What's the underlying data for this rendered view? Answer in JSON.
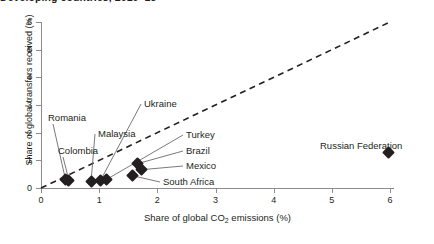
{
  "chart_data": {
    "type": "scatter",
    "title": "Developing countries, 2010–15",
    "xlabel": "Share of global CO2 emissions (%)",
    "xlabel_pre": "Share of global CO",
    "xlabel_sub": "2",
    "xlabel_post": " emissions (%)",
    "ylabel": "Share of global transfers received (%)",
    "xlim": [
      0,
      6
    ],
    "ylim": [
      0,
      6
    ],
    "xticks": [
      0,
      1,
      2,
      3,
      4,
      5,
      6
    ],
    "yticks": [
      0,
      1,
      2,
      3,
      4,
      5,
      6
    ],
    "xtick_labels": [
      "0",
      "1",
      "2",
      "3",
      "4",
      "5",
      "6"
    ],
    "ytick_labels": [
      "0",
      "1",
      "2",
      "3",
      "4",
      "5",
      "6"
    ],
    "grid": false,
    "legend": "none",
    "reference_line": {
      "name": "parity-line",
      "style": "dashed",
      "from": [
        0,
        0
      ],
      "to": [
        6.0,
        6.0
      ]
    },
    "points": [
      {
        "label": "Romania",
        "x": 0.42,
        "y": 0.32
      },
      {
        "label": "Colombia",
        "x": 0.48,
        "y": 0.28
      },
      {
        "label": "Malaysia",
        "x": 0.86,
        "y": 0.22
      },
      {
        "label": "Ukraine",
        "x": 1.02,
        "y": 0.26
      },
      {
        "label": "Turkey",
        "x": 1.12,
        "y": 0.3
      },
      {
        "label": "Brazil",
        "x": 1.66,
        "y": 0.88
      },
      {
        "label": "Mexico",
        "x": 1.72,
        "y": 0.66
      },
      {
        "label": "South Africa",
        "x": 1.58,
        "y": 0.44
      },
      {
        "label": "Russian Federation",
        "x": 5.98,
        "y": 1.3
      }
    ],
    "point_labels": [
      {
        "text": "Romania",
        "lx": 48,
        "ly": 113
      },
      {
        "text": "Colombia",
        "lx": 58,
        "ly": 146
      },
      {
        "text": "Malaysia",
        "lx": 98,
        "ly": 129
      },
      {
        "text": "Ukraine",
        "lx": 144,
        "ly": 99
      },
      {
        "text": "Turkey",
        "lx": 186,
        "ly": 130
      },
      {
        "text": "Brazil",
        "lx": 186,
        "ly": 146
      },
      {
        "text": "Mexico",
        "lx": 186,
        "ly": 161
      },
      {
        "text": "South Africa",
        "lx": 163,
        "ly": 177
      },
      {
        "text": "Russian Federation",
        "lx": 320,
        "ly": 141
      }
    ]
  },
  "colors": {
    "marker": "#231f20",
    "axis": "#8d8b8c",
    "text": "#231f20",
    "leader": "#6d6a6b",
    "background": "#ffffff"
  }
}
